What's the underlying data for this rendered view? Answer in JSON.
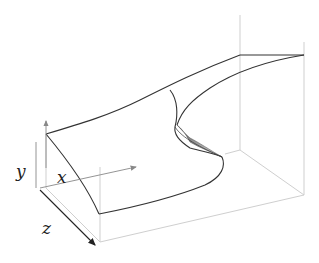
{
  "figure": {
    "type": "3d-surface-diagram",
    "axes": {
      "x_label": "x",
      "y_label": "y",
      "z_label": "z"
    },
    "colors": {
      "surface_edge": "#333333",
      "box": "#cfcfcf",
      "axis_arrow": "#888888",
      "z_axis_arrow": "#222222"
    }
  }
}
